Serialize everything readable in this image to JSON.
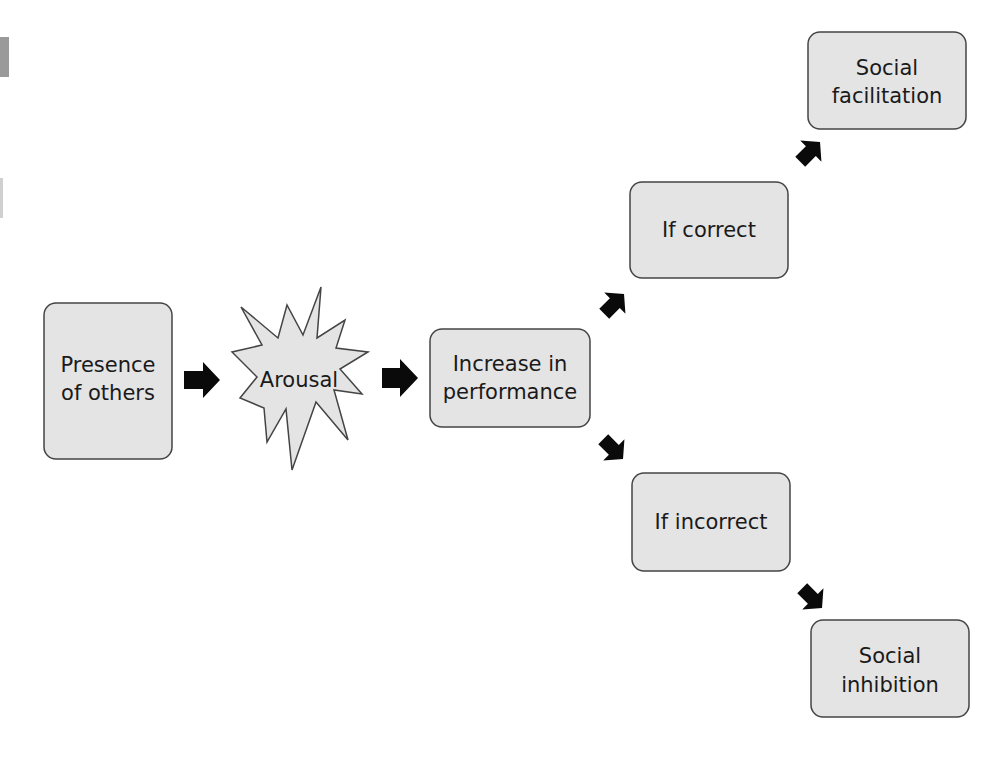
{
  "diagram": {
    "nodes": [
      {
        "id": "presence",
        "lines": [
          "Presence",
          "of others"
        ],
        "shape": "rounded-box"
      },
      {
        "id": "arousal",
        "lines": [
          "Arousal"
        ],
        "shape": "starburst"
      },
      {
        "id": "increase",
        "lines": [
          "Increase in",
          "performance"
        ],
        "shape": "rounded-box"
      },
      {
        "id": "correct",
        "lines": [
          "If correct"
        ],
        "shape": "rounded-box"
      },
      {
        "id": "incorrect",
        "lines": [
          "If incorrect"
        ],
        "shape": "rounded-box"
      },
      {
        "id": "facilitation",
        "lines": [
          "Social",
          "facilitation"
        ],
        "shape": "rounded-box"
      },
      {
        "id": "inhibition",
        "lines": [
          "Social",
          "inhibition"
        ],
        "shape": "rounded-box"
      }
    ],
    "edges": [
      {
        "from": "presence",
        "to": "arousal"
      },
      {
        "from": "arousal",
        "to": "increase"
      },
      {
        "from": "increase",
        "to": "correct"
      },
      {
        "from": "increase",
        "to": "incorrect"
      },
      {
        "from": "correct",
        "to": "facilitation"
      },
      {
        "from": "incorrect",
        "to": "inhibition"
      }
    ],
    "colors": {
      "box_fill": "#e4e4e4",
      "box_stroke": "#444444",
      "arrow": "#0a0a0a",
      "text": "#1a1a1a"
    }
  }
}
